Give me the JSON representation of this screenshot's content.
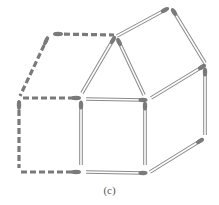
{
  "figure": {
    "caption": "(c)",
    "colors": {
      "match_outline": "#8a8a8a",
      "match_body": "#ffffff",
      "match_head": "#7a7a7a",
      "dashed": "#7a7a7a",
      "caption": "#555555"
    },
    "solid_matches": [
      {
        "name": "match-roof-left",
        "x1": 82,
        "y1": 93,
        "x2": 113,
        "y2": 40
      },
      {
        "name": "match-roof-right",
        "x1": 144,
        "y1": 95,
        "x2": 119,
        "y2": 42
      },
      {
        "name": "match-top-slant",
        "x1": 117,
        "y1": 36,
        "x2": 165,
        "y2": 10
      },
      {
        "name": "match-top-right",
        "x1": 205,
        "y1": 63,
        "x2": 174,
        "y2": 12
      },
      {
        "name": "match-middle-slant",
        "x1": 151,
        "y1": 98,
        "x2": 202,
        "y2": 67
      },
      {
        "name": "match-mid-horizontal",
        "x1": 86,
        "y1": 99,
        "x2": 143,
        "y2": 100
      },
      {
        "name": "match-center-left-vertical",
        "x1": 81,
        "y1": 165,
        "x2": 81,
        "y2": 105
      },
      {
        "name": "match-center-right-vertical",
        "x1": 145,
        "y1": 165,
        "x2": 145,
        "y2": 106
      },
      {
        "name": "match-right-vertical",
        "x1": 205,
        "y1": 135,
        "x2": 205,
        "y2": 72
      },
      {
        "name": "match-bottom-horizontal",
        "x1": 86,
        "y1": 172,
        "x2": 143,
        "y2": 173
      },
      {
        "name": "match-bottom-slant",
        "x1": 150,
        "y1": 172,
        "x2": 200,
        "y2": 141
      }
    ],
    "dashed_matches": [
      {
        "name": "dashed-top",
        "x1": 55,
        "y1": 34,
        "x2": 114,
        "y2": 35
      },
      {
        "name": "dashed-upper-left-slant",
        "x1": 48,
        "y1": 37,
        "x2": 20,
        "y2": 96
      },
      {
        "name": "dashed-mid-left",
        "x1": 23,
        "y1": 98,
        "x2": 78,
        "y2": 98
      },
      {
        "name": "dashed-left-vertical",
        "x1": 19,
        "y1": 101,
        "x2": 19,
        "y2": 168
      },
      {
        "name": "dashed-bottom-left",
        "x1": 21,
        "y1": 172,
        "x2": 78,
        "y2": 172
      }
    ],
    "dashed_heads": [
      {
        "name": "head-top-left",
        "cx": 58,
        "cy": 34,
        "rx": 5,
        "ry": 2.2,
        "rot": 0
      },
      {
        "name": "head-upper-left",
        "cx": 46,
        "cy": 41,
        "rx": 5,
        "ry": 2,
        "rot": -65
      },
      {
        "name": "head-mid-left",
        "cx": 76,
        "cy": 98,
        "rx": 5,
        "ry": 2.2,
        "rot": 0
      },
      {
        "name": "head-left-vertical",
        "cx": 19,
        "cy": 105,
        "rx": 5,
        "ry": 2.2,
        "rot": 90
      },
      {
        "name": "head-bottom-left",
        "cx": 76,
        "cy": 172,
        "rx": 5,
        "ry": 2.2,
        "rot": 0
      }
    ]
  }
}
